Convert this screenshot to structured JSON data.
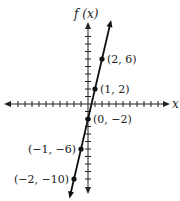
{
  "chart_data": {
    "type": "line",
    "title": "",
    "xlabel": "x",
    "ylabel": "f(x)",
    "function": "f(x) = 4x - 2",
    "x": [
      -2,
      -1,
      0,
      1,
      2
    ],
    "values": [
      -10,
      -6,
      -2,
      2,
      6
    ],
    "points": [
      {
        "x": 2,
        "y": 6,
        "label": "(2, 6)"
      },
      {
        "x": 1,
        "y": 2,
        "label": "(1, 2)"
      },
      {
        "x": 0,
        "y": -2,
        "label": "(0, −2)"
      },
      {
        "x": -1,
        "y": -6,
        "label": "(−1, −6)"
      },
      {
        "x": -2,
        "y": -10,
        "label": "(−2, −10)"
      }
    ],
    "xlim": [
      -10,
      10
    ],
    "ylim": [
      -12,
      12
    ],
    "grid": false,
    "legend": "none"
  },
  "axes": {
    "x_label": "x",
    "y_label": "f (x)"
  },
  "colors": {
    "line": "#111111",
    "axis": "#222222",
    "background": "#ffffff"
  }
}
